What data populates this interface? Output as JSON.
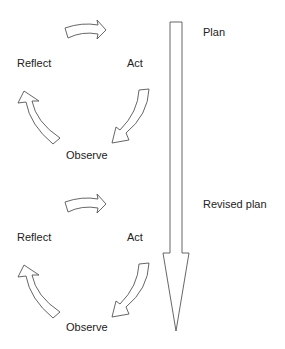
{
  "diagram": {
    "title": "",
    "cycles": [
      {
        "name": "upper-cycle",
        "labels": {
          "reflect": "Reflect",
          "act": "Act",
          "observe": "Observe"
        }
      },
      {
        "name": "lower-cycle",
        "labels": {
          "reflect": "Reflect",
          "act": "Act",
          "observe": "Observe"
        }
      }
    ],
    "timeline": {
      "labels": {
        "plan": "Plan",
        "revised_plan": "Revised plan"
      },
      "direction": "down"
    },
    "colors": {
      "stroke": "#555555",
      "fill": "#ffffff",
      "text": "#222222"
    }
  }
}
